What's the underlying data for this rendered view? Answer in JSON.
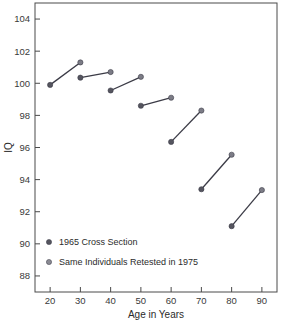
{
  "chart_data": {
    "type": "scatter",
    "title": "",
    "xlabel": "Age in Years",
    "ylabel": "IQ",
    "xlim": [
      15,
      95
    ],
    "ylim": [
      87,
      105
    ],
    "xticks": [
      20,
      30,
      40,
      50,
      60,
      70,
      80,
      90
    ],
    "yticks": [
      88,
      90,
      92,
      94,
      96,
      98,
      100,
      102,
      104
    ],
    "grid": false,
    "legend_position": "lower-left-inside",
    "series": [
      {
        "name": "1965 Cross Section",
        "color": "#55555f",
        "x": [
          20,
          30,
          40,
          50,
          60,
          70,
          80
        ],
        "values": [
          99.9,
          100.35,
          99.55,
          98.6,
          96.35,
          93.4,
          91.1
        ]
      },
      {
        "name": "Same Individuals Retested in 1975",
        "color": "#7c7c86",
        "x": [
          30,
          40,
          50,
          60,
          70,
          80,
          90
        ],
        "values": [
          101.3,
          100.7,
          100.4,
          99.1,
          98.3,
          95.55,
          93.35
        ]
      }
    ],
    "pairs": [
      {
        "x1": 20,
        "y1": 99.9,
        "x2": 30,
        "y2": 101.3
      },
      {
        "x1": 30,
        "y1": 100.35,
        "x2": 40,
        "y2": 100.7
      },
      {
        "x1": 40,
        "y1": 99.55,
        "x2": 50,
        "y2": 100.4
      },
      {
        "x1": 50,
        "y1": 98.6,
        "x2": 60,
        "y2": 99.1
      },
      {
        "x1": 60,
        "y1": 96.35,
        "x2": 70,
        "y2": 98.3
      },
      {
        "x1": 70,
        "y1": 93.4,
        "x2": 80,
        "y2": 95.55
      },
      {
        "x1": 80,
        "y1": 91.1,
        "x2": 90,
        "y2": 93.35
      }
    ],
    "xtick_labels": [
      "20",
      "30",
      "40",
      "50",
      "60",
      "70",
      "80",
      "90"
    ],
    "ytick_labels": [
      "88",
      "90",
      "92",
      "94",
      "96",
      "98",
      "100",
      "102",
      "104"
    ],
    "legend": [
      {
        "label": "1965 Cross Section",
        "color": "#55555f"
      },
      {
        "label": "Same Individuals Retested in 1975",
        "color": "#8a8a93"
      }
    ]
  },
  "style": {
    "line_color": "#3b3b46",
    "axis_color": "#4a4a4a",
    "background": "#ffffff"
  }
}
